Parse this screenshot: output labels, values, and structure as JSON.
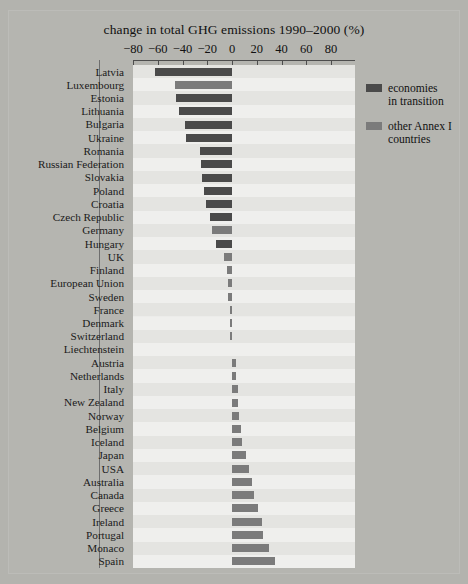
{
  "figure": {
    "title": "change in total GHG emissions 1990–2000 (%)",
    "background_color": "#b3b3ae",
    "panel_color": "#ececea"
  },
  "legend": {
    "position": "top-right",
    "items": [
      {
        "label_line1": "economies",
        "label_line2": "in transition",
        "color": "#4a4a4a",
        "key": "eit"
      },
      {
        "label_line1": "other Annex I",
        "label_line2": "countries",
        "color": "#7b7b7b",
        "key": "annex"
      }
    ]
  },
  "axis": {
    "ticks": [
      -80,
      -60,
      -40,
      -20,
      0,
      20,
      40,
      60,
      80
    ],
    "tick_labels": [
      "−80",
      "−60",
      "−40",
      "−20",
      "0",
      "20",
      "40",
      "60",
      "80"
    ],
    "min": -80,
    "max": 80
  },
  "chart_data": {
    "type": "bar",
    "orientation": "horizontal",
    "title": "change in total GHG emissions 1990–2000 (%)",
    "xlabel": "change in total GHG emissions 1990–2000 (%)",
    "ylabel": "",
    "xlim": [
      -80,
      80
    ],
    "grid": false,
    "legend_position": "top-right",
    "series": [
      {
        "name": "economies in transition",
        "color": "#4a4a4a"
      },
      {
        "name": "other Annex I countries",
        "color": "#7b7b7b"
      }
    ],
    "categories": [
      "Latvia",
      "Luxembourg",
      "Estonia",
      "Lithuania",
      "Bulgaria",
      "Ukraine",
      "Romania",
      "Russian Federation",
      "Slovakia",
      "Poland",
      "Croatia",
      "Czech Republic",
      "Germany",
      "Hungary",
      "UK",
      "Finland",
      "European Union",
      "Sweden",
      "France",
      "Denmark",
      "Switzerland",
      "Liechtenstein",
      "Austria",
      "Netherlands",
      "Italy",
      "New Zealand",
      "Norway",
      "Belgium",
      "Iceland",
      "Japan",
      "USA",
      "Australia",
      "Canada",
      "Greece",
      "Ireland",
      "Portugal",
      "Monaco",
      "Spain"
    ],
    "values": [
      -62,
      -46,
      -45,
      -43,
      -38,
      -37,
      -26,
      -25,
      -24,
      -23,
      -21,
      -18,
      -16,
      -13,
      -6.5,
      -4,
      -3.5,
      -3,
      -2,
      -1.5,
      -1.5,
      0,
      3,
      3,
      4.5,
      5,
      6,
      7,
      8,
      11,
      14,
      16,
      18,
      21,
      24,
      25,
      30,
      35
    ],
    "group": [
      "eit",
      "annex",
      "eit",
      "eit",
      "eit",
      "eit",
      "eit",
      "eit",
      "eit",
      "eit",
      "eit",
      "eit",
      "annex",
      "eit",
      "annex",
      "annex",
      "annex",
      "annex",
      "annex",
      "annex",
      "annex",
      "annex",
      "annex",
      "annex",
      "annex",
      "annex",
      "annex",
      "annex",
      "annex",
      "annex",
      "annex",
      "annex",
      "annex",
      "annex",
      "annex",
      "annex",
      "annex",
      "annex"
    ]
  }
}
